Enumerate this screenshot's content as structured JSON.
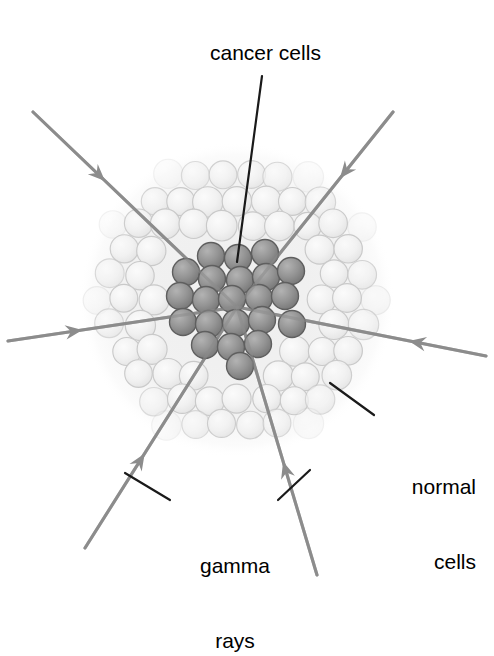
{
  "diagram": {
    "background_color": "#ffffff",
    "labels": {
      "cancer_cells": "cancer cells",
      "normal_cells_line1": "normal",
      "normal_cells_line2": "cells",
      "gamma_line1": "gamma",
      "gamma_line2": "rays"
    },
    "colors": {
      "label_text": "#000000",
      "leader_line": "#1a1a1a",
      "ray": "#8c8c8c",
      "normal_cell_fill": "#f2f2f2",
      "normal_cell_stroke": "#c9c9c9",
      "cancer_cell_fill": "#8f8f8f",
      "cancer_cell_stroke": "#5f5f5f",
      "mass_halo": "#f7f7f7"
    },
    "geometry": {
      "focus_x": 237,
      "focus_y": 307,
      "mass_center_x": 237,
      "mass_center_y": 300,
      "mass_radius": 148,
      "normal_cell_radius": 14.5,
      "cancer_cell_radius": 13.5,
      "ray_count": 6,
      "cancer_cell_count": 22
    },
    "rays": [
      {
        "name": "ray-upper-left",
        "x1": 33,
        "y1": 112,
        "x2": 237,
        "y2": 307,
        "arrow_t": 0.3
      },
      {
        "name": "ray-upper-right",
        "x1": 393,
        "y1": 112,
        "x2": 237,
        "y2": 307,
        "arrow_t": 0.28
      },
      {
        "name": "ray-left",
        "x1": 8,
        "y1": 341,
        "x2": 237,
        "y2": 307,
        "arrow_t": 0.26
      },
      {
        "name": "ray-right",
        "x1": 486,
        "y1": 356,
        "x2": 237,
        "y2": 307,
        "arrow_t": 0.25
      },
      {
        "name": "ray-lower-left",
        "x1": 85,
        "y1": 548,
        "x2": 237,
        "y2": 307,
        "arrow_t": 0.34
      },
      {
        "name": "ray-lower-right",
        "x1": 317,
        "y1": 575,
        "x2": 237,
        "y2": 307,
        "arrow_t": 0.37
      }
    ],
    "leaders": [
      {
        "name": "leader-cancer-cells",
        "x1": 262,
        "y1": 76,
        "x2": 237,
        "y2": 262
      },
      {
        "name": "leader-normal-cells",
        "x1": 374,
        "y1": 415,
        "x2": 330,
        "y2": 383
      },
      {
        "name": "leader-gamma-left",
        "x1": 170,
        "y1": 500,
        "x2": 125,
        "y2": 473
      },
      {
        "name": "leader-gamma-right",
        "x1": 278,
        "y1": 500,
        "x2": 310,
        "y2": 470
      }
    ],
    "cancer_cells": [
      {
        "x": 211,
        "y": 256
      },
      {
        "x": 238,
        "y": 258
      },
      {
        "x": 265,
        "y": 253
      },
      {
        "x": 186,
        "y": 272
      },
      {
        "x": 212,
        "y": 279
      },
      {
        "x": 240,
        "y": 280
      },
      {
        "x": 266,
        "y": 277
      },
      {
        "x": 291,
        "y": 271
      },
      {
        "x": 180,
        "y": 296
      },
      {
        "x": 206,
        "y": 300
      },
      {
        "x": 232,
        "y": 299
      },
      {
        "x": 259,
        "y": 298
      },
      {
        "x": 285,
        "y": 296
      },
      {
        "x": 183,
        "y": 322
      },
      {
        "x": 209,
        "y": 324
      },
      {
        "x": 236,
        "y": 323
      },
      {
        "x": 262,
        "y": 320
      },
      {
        "x": 292,
        "y": 324
      },
      {
        "x": 205,
        "y": 345
      },
      {
        "x": 231,
        "y": 347
      },
      {
        "x": 258,
        "y": 344
      },
      {
        "x": 240,
        "y": 366
      }
    ]
  }
}
